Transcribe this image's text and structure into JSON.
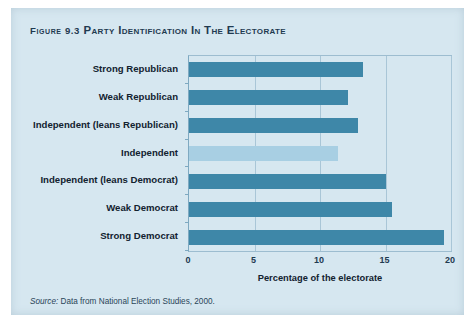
{
  "figure": {
    "label": "Figure 9.3",
    "title": "Party Identification in the Electorate",
    "source": "Source: Data from National Election Studies, 2000.",
    "source_label": "Source:",
    "source_text": " Data from National Election Studies, 2000."
  },
  "colors": {
    "card_background": "#d6e7f0",
    "bar_dark": "#3e87a8",
    "bar_light": "#a8cfe3",
    "gridline": "#a9c6d7",
    "frame": "#9dbdd0",
    "text": "#12222f"
  },
  "chart_data": {
    "type": "bar",
    "orientation": "horizontal",
    "title": "Party Identification in the Electorate",
    "categories": [
      "Strong Republican",
      "Weak Republican",
      "Independent (leans Republican)",
      "Independent",
      "Independent (leans Democrat)",
      "Weak Democrat",
      "Strong Democrat"
    ],
    "values": [
      13.3,
      12.1,
      12.9,
      11.4,
      15.0,
      15.5,
      19.5
    ],
    "bar_colors": [
      "#3e87a8",
      "#3e87a8",
      "#3e87a8",
      "#a8cfe3",
      "#3e87a8",
      "#3e87a8",
      "#3e87a8"
    ],
    "xlabel": "Percentage of the electorate",
    "ylabel": "",
    "xlim": [
      0,
      20
    ],
    "xticks": [
      0,
      5,
      10,
      15,
      20
    ],
    "xtick_labels": [
      "0",
      "5",
      "10",
      "15",
      "20"
    ],
    "grid": true,
    "grid_axis": "x",
    "legend": false
  }
}
